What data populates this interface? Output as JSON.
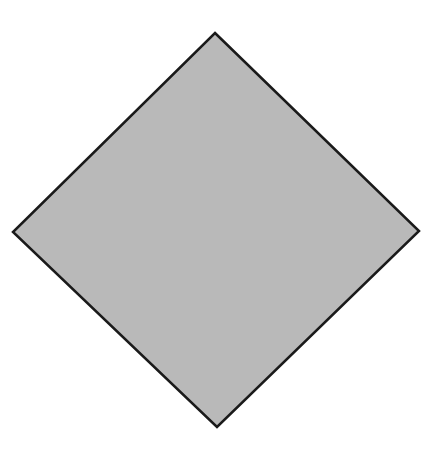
{
  "diagram": {
    "shape": "diamond",
    "vertices": {
      "top": [
        215,
        33
      ],
      "right": [
        419,
        231
      ],
      "bottom": [
        217,
        427
      ],
      "left": [
        13,
        232
      ]
    },
    "fill_color": "#b9b9b9",
    "stroke_color": "#1a1a1a",
    "stroke_width": 2.5,
    "background_color": "#ffffff"
  }
}
